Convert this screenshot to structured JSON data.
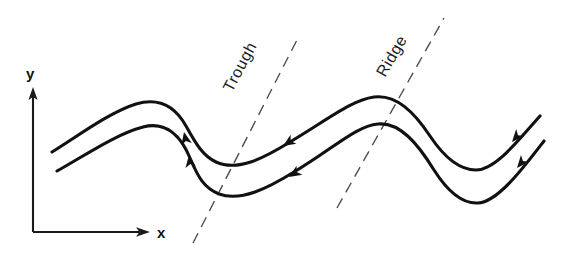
{
  "figure": {
    "kind": "streamline-diagram",
    "background_color": "#ffffff",
    "width": 567,
    "height": 258
  },
  "axes": {
    "y_label": "y",
    "x_label": "x",
    "color": "#1a1a1a",
    "origin": {
      "x": 33,
      "y": 232
    },
    "y_axis_top": {
      "x": 33,
      "y": 88
    },
    "x_axis_right": {
      "x": 148,
      "y": 232
    },
    "y_label_pos": {
      "x": 26,
      "y": 78
    },
    "x_label_pos": {
      "x": 158,
      "y": 238
    }
  },
  "guides": [
    {
      "id": "trough",
      "label": "Trough",
      "style": "dashed",
      "color": "#4a4a4a",
      "start": {
        "x": 193,
        "y": 243
      },
      "end": {
        "x": 299,
        "y": 36
      },
      "label_pos": {
        "x": 232,
        "y": 93
      },
      "label_rotation": -62
    },
    {
      "id": "ridge",
      "label": "Ridge",
      "style": "dashed",
      "color": "#4a4a4a",
      "start": {
        "x": 337,
        "y": 208
      },
      "end": {
        "x": 444,
        "y": 18
      },
      "label_pos": {
        "x": 385,
        "y": 78
      },
      "label_rotation": -60
    }
  ],
  "streamlines": [
    {
      "id": "upper-streamline",
      "color": "#111111",
      "stroke_width": 3.1,
      "path": "M 52,152 C 78,136 110,112 136,104 C 160,97 176,108 186,126 C 196,144 203,156 216,162 C 238,172 264,158 290,142 C 330,118 352,100 374,97 C 396,94 414,112 430,136 C 444,157 460,170 476,170 C 496,170 520,138 540,116",
      "arrows": [
        {
          "x": 184,
          "y": 130,
          "angle": 78
        },
        {
          "x": 281,
          "y": 147,
          "angle": -31
        },
        {
          "x": 509,
          "y": 145,
          "angle": -48
        }
      ]
    },
    {
      "id": "lower-streamline",
      "color": "#111111",
      "stroke_width": 3.1,
      "path": "M 57,171 C 84,156 116,134 143,127 C 166,121 181,136 190,158 C 198,177 204,188 219,194 C 241,202 268,188 294,172 C 334,148 356,126 378,124 C 400,122 418,144 434,170 C 448,192 462,204 478,203 C 498,202 524,167 544,141",
      "arrows": [
        {
          "x": 188,
          "y": 151,
          "angle": 74
        },
        {
          "x": 288,
          "y": 178,
          "angle": -31
        },
        {
          "x": 514,
          "y": 171,
          "angle": -50
        }
      ]
    }
  ],
  "colors": {
    "ink": "#111111",
    "axis": "#1a1a1a",
    "guide": "#4a4a4a",
    "paper": "#ffffff"
  }
}
